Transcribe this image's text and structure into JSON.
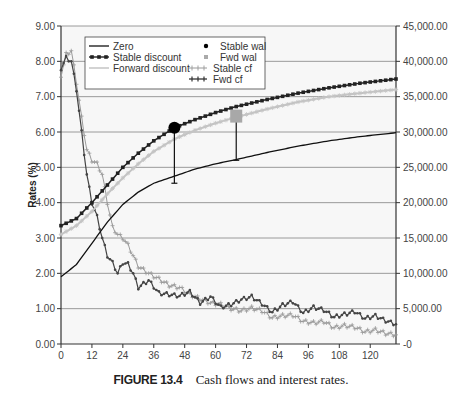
{
  "figure": {
    "label": "FIGURE 13.4",
    "caption": "Cash flows and interest rates."
  },
  "chart_data": {
    "type": "line",
    "title": "",
    "xlabel": "",
    "ylabel": "Rates (%)",
    "y2label": "",
    "xlim": [
      0,
      130
    ],
    "ylim": [
      0,
      9
    ],
    "y2lim": [
      0,
      45000
    ],
    "xticks": [
      0,
      12,
      24,
      36,
      48,
      60,
      72,
      84,
      96,
      108,
      120
    ],
    "yticks": [
      "0.00",
      "1.00",
      "2.00",
      "3.00",
      "4.00",
      "5.00",
      "6.00",
      "7.00",
      "8.00",
      "9.00"
    ],
    "y2ticks": [
      "-0",
      "5,000.00",
      "10,000.00",
      "15,000.00",
      "20,000.00",
      "25,000.00",
      "30,000.00",
      "35,000.00",
      "40,000.00",
      "45,000.00"
    ],
    "grid": "horizontal",
    "legend_position": "upper-left inside",
    "legend": [
      "Zero",
      "Stable discount",
      "Forward discount",
      "Stable wal",
      "Fwd wal",
      "Stable cf",
      "Fwd cf"
    ],
    "series": [
      {
        "name": "Zero",
        "axis": "left",
        "style": "solid black line",
        "x": [
          0,
          6,
          12,
          18,
          24,
          30,
          36,
          44,
          52,
          60,
          68,
          80,
          92,
          104,
          116,
          130
        ],
        "values": [
          1.9,
          2.25,
          2.85,
          3.45,
          3.95,
          4.3,
          4.55,
          4.75,
          4.95,
          5.1,
          5.22,
          5.42,
          5.6,
          5.75,
          5.87,
          5.98
        ]
      },
      {
        "name": "Stable discount",
        "axis": "left",
        "style": "black line, square markers",
        "x": [
          0,
          6,
          12,
          18,
          24,
          30,
          36,
          44,
          52,
          60,
          68,
          80,
          92,
          104,
          116,
          130
        ],
        "values": [
          3.35,
          3.55,
          4.0,
          4.5,
          5.0,
          5.4,
          5.75,
          6.12,
          6.35,
          6.55,
          6.72,
          6.92,
          7.1,
          7.25,
          7.38,
          7.5
        ]
      },
      {
        "name": "Forward discount",
        "axis": "left",
        "style": "light gray line, star markers",
        "x": [
          0,
          6,
          12,
          18,
          24,
          30,
          36,
          44,
          52,
          60,
          68,
          80,
          92,
          104,
          116,
          130
        ],
        "values": [
          3.1,
          3.35,
          3.75,
          4.25,
          4.7,
          5.1,
          5.45,
          5.8,
          6.05,
          6.25,
          6.42,
          6.65,
          6.85,
          7.0,
          7.1,
          7.2
        ]
      },
      {
        "name": "Stable wal",
        "axis": "left",
        "style": "black circle marker",
        "x": [
          44
        ],
        "values": [
          6.12
        ],
        "drop_to": 4.55
      },
      {
        "name": "Fwd wal",
        "axis": "left",
        "style": "gray square marker",
        "x": [
          68
        ],
        "values": [
          6.45
        ],
        "drop_to": 5.2
      },
      {
        "name": "Stable cf",
        "axis": "right",
        "style": "gray line, plus markers",
        "x": [
          0,
          2,
          4,
          6,
          8,
          10,
          12,
          14,
          16,
          18,
          20,
          22,
          24,
          26,
          28,
          30,
          34,
          38,
          42,
          46,
          50,
          54,
          58,
          62,
          66,
          70,
          74,
          78,
          82,
          86,
          90,
          94,
          98,
          102,
          106,
          110,
          114,
          118,
          122,
          126,
          130
        ],
        "values": [
          38000,
          41000,
          41500,
          37000,
          32000,
          27500,
          26000,
          25500,
          24000,
          20000,
          16500,
          15500,
          15000,
          14000,
          12500,
          11000,
          10000,
          9200,
          8300,
          8000,
          7000,
          6400,
          5800,
          5600,
          5000,
          4700,
          5100,
          4700,
          3700,
          4000,
          4100,
          3200,
          3000,
          3200,
          2300,
          2600,
          2400,
          1700,
          2000,
          1500,
          1300
        ]
      },
      {
        "name": "Fwd cf",
        "axis": "right",
        "style": "dark line, diamond markers",
        "x": [
          0,
          2,
          4,
          6,
          8,
          10,
          12,
          14,
          16,
          18,
          20,
          22,
          24,
          26,
          28,
          30,
          34,
          38,
          42,
          46,
          50,
          54,
          58,
          62,
          66,
          70,
          74,
          78,
          82,
          86,
          90,
          94,
          98,
          102,
          106,
          110,
          114,
          118,
          122,
          126,
          130
        ],
        "values": [
          39000,
          40500,
          40000,
          36000,
          30000,
          24000,
          20000,
          18000,
          15000,
          12500,
          11500,
          10000,
          11500,
          11300,
          10000,
          8000,
          9000,
          7200,
          7000,
          6800,
          7400,
          5800,
          6700,
          5200,
          5600,
          6300,
          6700,
          5700,
          4500,
          5500,
          6000,
          4400,
          5200,
          4800,
          3800,
          4200,
          4600,
          3600,
          4000,
          3300,
          2800
        ]
      }
    ]
  }
}
